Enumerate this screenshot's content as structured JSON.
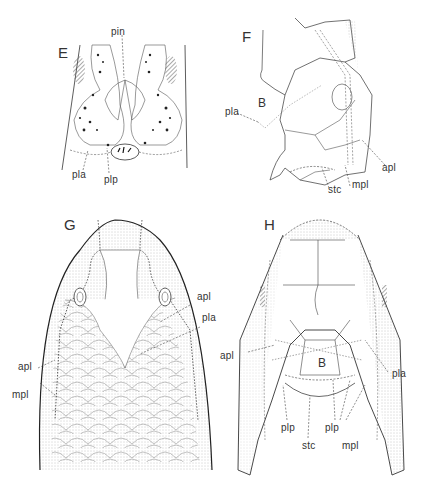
{
  "figure": {
    "panels": [
      {
        "id": "E",
        "label": "E",
        "labels": [
          "pin",
          "pla",
          "plp"
        ]
      },
      {
        "id": "F",
        "label": "F",
        "labels": [
          "B",
          "pla",
          "apl",
          "stc",
          "mpl"
        ]
      },
      {
        "id": "G",
        "label": "G",
        "labels": [
          "apl",
          "pla",
          "apl",
          "mpl"
        ]
      },
      {
        "id": "H",
        "label": "H",
        "labels": [
          "B",
          "apl",
          "pla",
          "plp",
          "stc",
          "plp",
          "mpl"
        ]
      }
    ]
  },
  "panelE": {
    "letter": "E",
    "pin": "pin",
    "pla": "pla",
    "plp": "plp"
  },
  "panelF": {
    "letter": "F",
    "B": "B",
    "pla": "pla",
    "apl": "apl",
    "stc": "stc",
    "mpl": "mpl"
  },
  "panelG": {
    "letter": "G",
    "apl_right": "apl",
    "pla_right": "pla",
    "apl_left": "apl",
    "mpl_left": "mpl"
  },
  "panelH": {
    "letter": "H",
    "B": "B",
    "apl": "apl",
    "pla": "pla",
    "plp_left": "plp",
    "stc": "stc",
    "plp_right": "plp",
    "mpl": "mpl"
  }
}
